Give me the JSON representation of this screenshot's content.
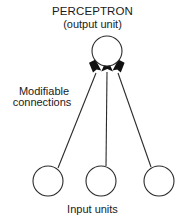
{
  "figure": {
    "title": "PERCEPTRON",
    "subtitle": "(output unit)",
    "connections_label_line1": "Modifiable",
    "connections_label_line2": "connections",
    "input_caption": "Input units",
    "stroke_color": "#2b2b2b",
    "arrow_fill": "#111111",
    "background": "#ffffff"
  },
  "diagram_data": {
    "type": "node-link-diagram",
    "output_node": {
      "cx": 107,
      "cy": 51,
      "r": 15
    },
    "input_nodes": [
      {
        "cx": 48,
        "cy": 181,
        "r": 15
      },
      {
        "cx": 101,
        "cy": 181,
        "r": 15
      },
      {
        "cx": 159,
        "cy": 181,
        "r": 15
      }
    ],
    "edges": [
      {
        "from": "input-1",
        "to": "output",
        "arrow": true
      },
      {
        "from": "input-2",
        "to": "output",
        "arrow": true
      },
      {
        "from": "input-3",
        "to": "output",
        "arrow": true
      }
    ]
  }
}
